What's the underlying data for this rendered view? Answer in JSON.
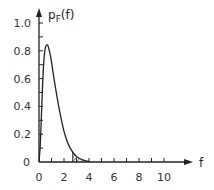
{
  "chart_data": {
    "type": "line",
    "title": "",
    "xlabel": "f",
    "ylabel": "p_F(f)",
    "ylabel_main": "p",
    "ylabel_sub": "F",
    "ylabel_arg": "(f)",
    "xlim": [
      0,
      10
    ],
    "ylim": [
      0,
      1.0
    ],
    "grid": false,
    "x_ticks": [
      0,
      1,
      2,
      3,
      4,
      5,
      6,
      7,
      8,
      9,
      10
    ],
    "x_tick_labels": [
      "0",
      "2",
      "4",
      "6",
      "8",
      "10"
    ],
    "x_tick_label_values": [
      0,
      2,
      4,
      6,
      8,
      10
    ],
    "y_tick_label_values": [
      0,
      0.2,
      0.4,
      0.6,
      0.8,
      1.0
    ],
    "y_tick_labels": [
      "0",
      "0.2",
      "0.4",
      "0.6",
      "0.8",
      "1.0"
    ],
    "series": [
      {
        "name": "p_F(f)",
        "x": [
          0,
          0.1,
          0.2,
          0.3,
          0.4,
          0.5,
          0.6,
          0.7,
          0.8,
          0.9,
          1.0,
          1.2,
          1.4,
          1.6,
          1.8,
          2.0,
          2.25,
          2.5,
          2.75,
          3.0,
          3.25,
          3.5,
          3.75,
          4.0
        ],
        "values": [
          0,
          0.12,
          0.35,
          0.58,
          0.74,
          0.82,
          0.84,
          0.84,
          0.81,
          0.77,
          0.72,
          0.6,
          0.49,
          0.39,
          0.3,
          0.22,
          0.15,
          0.1,
          0.065,
          0.04,
          0.025,
          0.015,
          0.008,
          0.004
        ]
      }
    ],
    "annotations": [
      {
        "type": "hatched_area",
        "x_start": 2.7,
        "x_end": 4.0,
        "description": "shaded tail region under curve"
      }
    ]
  }
}
